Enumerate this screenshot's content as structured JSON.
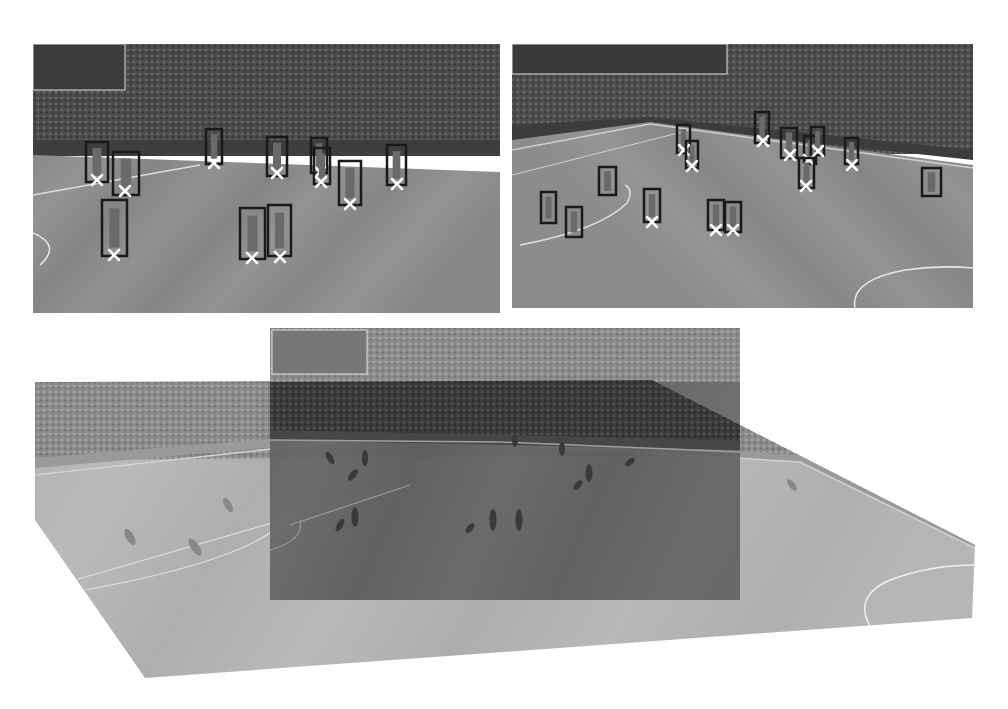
{
  "figure": {
    "colors": {
      "background": "#ffffff",
      "crowd_dark": "#3a3a3a",
      "crowd_mid": "#555555",
      "pitch_light": "#8f8f8f",
      "pitch_dark": "#7d7d7d",
      "pitch_line": "#e6e6e6",
      "box_stroke": "#1a1a1a",
      "foot_marker": "#ffffff",
      "overlay_tint": "#2e2e2e",
      "warped_light": "#b4b4b4"
    }
  },
  "panels": {
    "top_left": {
      "name": "frame-1",
      "rect": [
        33,
        44,
        467,
        269
      ],
      "detections": [
        {
          "box": [
            86,
            142,
            22,
            40
          ],
          "foot": [
            97,
            180
          ]
        },
        {
          "box": [
            113,
            152,
            26,
            43
          ],
          "foot": [
            125,
            191
          ]
        },
        {
          "box": [
            102,
            200,
            25,
            56
          ],
          "foot": [
            114,
            255
          ]
        },
        {
          "box": [
            206,
            129,
            16,
            35
          ],
          "foot": [
            214,
            163
          ]
        },
        {
          "box": [
            267,
            137,
            20,
            39
          ],
          "foot": [
            277,
            173
          ]
        },
        {
          "box": [
            311,
            138,
            16,
            35
          ],
          "foot": [
            320,
            172
          ]
        },
        {
          "box": [
            314,
            148,
            16,
            36
          ],
          "foot": [
            321,
            182
          ]
        },
        {
          "box": [
            339,
            161,
            22,
            44
          ],
          "foot": [
            350,
            204
          ]
        },
        {
          "box": [
            387,
            145,
            19,
            40
          ],
          "foot": [
            397,
            184
          ]
        },
        {
          "box": [
            240,
            208,
            25,
            51
          ],
          "foot": [
            252,
            258
          ]
        },
        {
          "box": [
            268,
            205,
            23,
            51
          ],
          "foot": [
            280,
            257
          ]
        }
      ]
    },
    "top_right": {
      "name": "frame-2",
      "rect": [
        512,
        44,
        461,
        264
      ],
      "detections": [
        {
          "box": [
            677,
            125,
            13,
            28
          ],
          "foot": [
            684,
            150
          ]
        },
        {
          "box": [
            686,
            141,
            12,
            27
          ],
          "foot": [
            692,
            166
          ]
        },
        {
          "box": [
            755,
            112,
            14,
            31
          ],
          "foot": [
            763,
            141
          ]
        },
        {
          "box": [
            781,
            128,
            16,
            30
          ],
          "foot": [
            790,
            155
          ]
        },
        {
          "box": [
            804,
            136,
            12,
            28
          ],
          "foot": [
            809,
            160
          ]
        },
        {
          "box": [
            811,
            127,
            13,
            28
          ],
          "foot": [
            818,
            151
          ]
        },
        {
          "box": [
            799,
            158,
            15,
            30
          ],
          "foot": [
            806,
            186
          ]
        },
        {
          "box": [
            845,
            138,
            13,
            26
          ],
          "foot": [
            852,
            165
          ]
        },
        {
          "box": [
            599,
            167,
            17,
            28
          ],
          "foot": null
        },
        {
          "box": [
            541,
            192,
            15,
            31
          ],
          "foot": null
        },
        {
          "box": [
            566,
            207,
            16,
            30
          ],
          "foot": null
        },
        {
          "box": [
            644,
            189,
            16,
            33
          ],
          "foot": [
            652,
            222
          ]
        },
        {
          "box": [
            708,
            200,
            16,
            30
          ],
          "foot": [
            716,
            230
          ]
        },
        {
          "box": [
            725,
            202,
            16,
            30
          ],
          "foot": [
            733,
            230
          ]
        },
        {
          "box": [
            922,
            168,
            19,
            28
          ],
          "foot": null
        }
      ]
    },
    "bottom": {
      "name": "warped-panorama",
      "warped_polygon": [
        [
          35,
          382
        ],
        [
          652,
          380
        ],
        [
          975,
          545
        ],
        [
          972,
          618
        ],
        [
          145,
          678
        ],
        [
          35,
          520
        ]
      ],
      "overlay_rect": [
        270,
        328,
        470,
        272
      ]
    }
  }
}
